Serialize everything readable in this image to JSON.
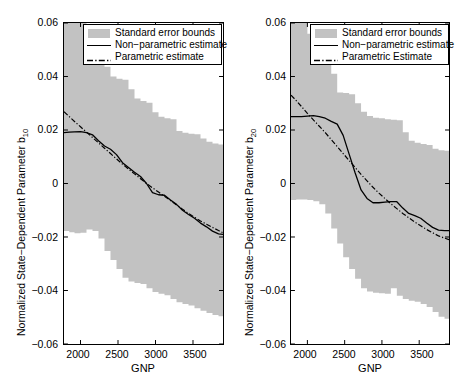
{
  "figure": {
    "fill_color": "#c2c2c2",
    "line_color": "#000000",
    "panels": [
      {
        "id": "b10",
        "ylabel_main": "Normalized State−Dependent Parameter b",
        "ylabel_sub": "10",
        "xlabel": "GNP",
        "yticks": [
          "0.06",
          "0.04",
          "0.02",
          "0",
          "−0.02",
          "−0.04",
          "−0.06"
        ],
        "xticks": [
          "2000",
          "2500",
          "3000",
          "3500"
        ],
        "legend": [
          "Standard error bounds",
          "Non−parametric estimate",
          "Parametric estimate"
        ]
      },
      {
        "id": "b20",
        "ylabel_main": "Normalized State−Dependent Parameter b",
        "ylabel_sub": "20",
        "xlabel": "GNP",
        "yticks": [
          "0.06",
          "0.04",
          "0.02",
          "0",
          "−0.02",
          "−0.04",
          "−0.06"
        ],
        "xticks": [
          "2000",
          "2500",
          "3000",
          "3500"
        ],
        "legend": [
          "Standard error bounds",
          "Non−parametric estimate",
          "Parametric Estimate"
        ]
      }
    ]
  },
  "chart_data": [
    {
      "type": "line",
      "title": "",
      "xlabel": "GNP",
      "ylabel": "Normalized State-Dependent Parameter b10",
      "xlim": [
        1780,
        3900
      ],
      "ylim": [
        -0.06,
        0.06
      ],
      "xtick_values": [
        2000,
        2500,
        3000,
        3500
      ],
      "ytick_values": [
        -0.06,
        -0.04,
        -0.02,
        0,
        0.02,
        0.04,
        0.06
      ],
      "grid": false,
      "legend_position": "top-right",
      "legend": [
        "Standard error bounds",
        "Non-parametric estimate",
        "Parametric estimate"
      ],
      "x": [
        1780,
        1850,
        1920,
        2000,
        2080,
        2160,
        2240,
        2320,
        2400,
        2480,
        2560,
        2640,
        2720,
        2800,
        2880,
        2960,
        3040,
        3120,
        3200,
        3280,
        3360,
        3440,
        3520,
        3600,
        3680,
        3760,
        3840,
        3900
      ],
      "series": [
        {
          "name": "Non-parametric estimate",
          "style": "solid",
          "values": [
            0.019,
            0.0192,
            0.0193,
            0.0194,
            0.019,
            0.0182,
            0.016,
            0.014,
            0.0128,
            0.0108,
            0.0078,
            0.006,
            0.0042,
            0.0026,
            0.0,
            -0.0034,
            -0.0042,
            -0.0044,
            -0.0062,
            -0.0078,
            -0.01,
            -0.0116,
            -0.013,
            -0.0148,
            -0.0162,
            -0.0178,
            -0.0188,
            -0.019
          ]
        },
        {
          "name": "Parametric estimate",
          "style": "dashdot",
          "values": [
            0.0268,
            0.025,
            0.0232,
            0.0212,
            0.0192,
            0.0172,
            0.0152,
            0.0132,
            0.0112,
            0.0092,
            0.0072,
            0.0054,
            0.0036,
            0.0018,
            0.0,
            -0.0016,
            -0.0032,
            -0.0048,
            -0.0064,
            -0.008,
            -0.0096,
            -0.0112,
            -0.0126,
            -0.014,
            -0.0152,
            -0.0164,
            -0.0176,
            -0.0184
          ]
        },
        {
          "name": "Standard error upper bound",
          "style": "band-upper",
          "values": [
            0.06,
            0.06,
            0.06,
            0.06,
            0.0518,
            0.0486,
            0.046,
            0.0436,
            0.04,
            0.0392,
            0.0388,
            0.0352,
            0.0318,
            0.0308,
            0.0302,
            0.0266,
            0.025,
            0.0244,
            0.024,
            0.0196,
            0.019,
            0.0186,
            0.0184,
            0.0168,
            0.0156,
            0.015,
            0.0146,
            0.0144
          ]
        },
        {
          "name": "Standard error lower bound",
          "style": "band-lower",
          "values": [
            -0.017,
            -0.0178,
            -0.0182,
            -0.0186,
            -0.0184,
            -0.0172,
            -0.0178,
            -0.0206,
            -0.0252,
            -0.0286,
            -0.032,
            -0.0352,
            -0.0366,
            -0.0372,
            -0.0376,
            -0.0392,
            -0.0406,
            -0.0412,
            -0.0418,
            -0.0432,
            -0.0444,
            -0.045,
            -0.0456,
            -0.0466,
            -0.0476,
            -0.0484,
            -0.0492,
            -0.0496
          ]
        }
      ]
    },
    {
      "type": "line",
      "title": "",
      "xlabel": "GNP",
      "ylabel": "Normalized State-Dependent Parameter b20",
      "xlim": [
        1780,
        3900
      ],
      "ylim": [
        -0.06,
        0.06
      ],
      "xtick_values": [
        2000,
        2500,
        3000,
        3500
      ],
      "ytick_values": [
        -0.06,
        -0.04,
        -0.02,
        0,
        0.02,
        0.04,
        0.06
      ],
      "grid": false,
      "legend_position": "top-right",
      "legend": [
        "Standard error bounds",
        "Non-parametric estimate",
        "Parametric Estimate"
      ],
      "x": [
        1780,
        1850,
        1920,
        2000,
        2080,
        2160,
        2240,
        2320,
        2400,
        2480,
        2560,
        2640,
        2720,
        2800,
        2880,
        2960,
        3040,
        3120,
        3200,
        3280,
        3360,
        3440,
        3520,
        3600,
        3680,
        3760,
        3840,
        3900
      ],
      "series": [
        {
          "name": "Non-parametric estimate",
          "style": "solid",
          "values": [
            0.025,
            0.025,
            0.025,
            0.0252,
            0.0254,
            0.025,
            0.0244,
            0.0232,
            0.0222,
            0.018,
            0.011,
            0.004,
            -0.0024,
            -0.0056,
            -0.0072,
            -0.0072,
            -0.007,
            -0.0068,
            -0.0068,
            -0.0092,
            -0.0112,
            -0.012,
            -0.013,
            -0.0148,
            -0.0164,
            -0.0174,
            -0.0176,
            -0.0176
          ]
        },
        {
          "name": "Parametric Estimate",
          "style": "dashdot",
          "values": [
            0.033,
            0.031,
            0.0288,
            0.0262,
            0.0238,
            0.0214,
            0.019,
            0.0164,
            0.0138,
            0.0112,
            0.0086,
            0.006,
            0.0034,
            0.001,
            -0.0014,
            -0.0036,
            -0.0056,
            -0.0076,
            -0.0094,
            -0.0112,
            -0.0128,
            -0.0144,
            -0.0158,
            -0.0172,
            -0.0184,
            -0.0196,
            -0.0204,
            -0.021
          ]
        },
        {
          "name": "Standard error upper bound",
          "style": "band-upper",
          "values": [
            0.06,
            0.06,
            0.06,
            0.056,
            0.0528,
            0.051,
            0.0492,
            0.041,
            0.034,
            0.0338,
            0.0334,
            0.03,
            0.0268,
            0.0252,
            0.0246,
            0.0244,
            0.024,
            0.0238,
            0.0236,
            0.0192,
            0.016,
            0.0152,
            0.0148,
            0.0144,
            0.013,
            0.0124,
            0.0122,
            0.012
          ]
        },
        {
          "name": "Standard error lower bound",
          "style": "band-lower",
          "values": [
            -0.0066,
            -0.0062,
            -0.006,
            -0.006,
            -0.0062,
            -0.0066,
            -0.0078,
            -0.0112,
            -0.0168,
            -0.0224,
            -0.0276,
            -0.032,
            -0.0356,
            -0.0392,
            -0.0404,
            -0.0408,
            -0.041,
            -0.0412,
            -0.0392,
            -0.042,
            -0.0432,
            -0.0438,
            -0.0442,
            -0.045,
            -0.0462,
            -0.048,
            -0.0498,
            -0.0506
          ]
        }
      ]
    }
  ]
}
